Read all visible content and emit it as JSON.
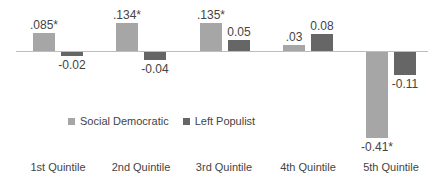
{
  "chart_data": {
    "type": "bar",
    "title": "",
    "xlabel": "",
    "ylabel": "",
    "categories": [
      "1st Quintile",
      "2nd Quintile",
      "3rd Quintile",
      "4th Quintile",
      "5th Quintile"
    ],
    "series": [
      {
        "name": "Social Democratic",
        "color": "#a6a6a6",
        "values": [
          0.085,
          0.134,
          0.135,
          0.03,
          -0.41
        ],
        "labels": [
          ".085*",
          ".134*",
          ".135*",
          ".03",
          "-0.41*"
        ]
      },
      {
        "name": "Left Populist",
        "color": "#666666",
        "values": [
          -0.02,
          -0.04,
          0.05,
          0.08,
          -0.11
        ],
        "labels": [
          "-0.02",
          "-0.04",
          "0.05",
          "0.08",
          "-0.11"
        ]
      }
    ],
    "ylim": [
      -0.42,
      0.15
    ],
    "grid": false,
    "legend_position": "inside-middle-left",
    "annotations": [
      "* denotes statistical significance"
    ]
  },
  "legend": {
    "items": [
      {
        "label": "Social Democratic",
        "color": "#a6a6a6"
      },
      {
        "label": "Left Populist",
        "color": "#666666"
      }
    ]
  }
}
